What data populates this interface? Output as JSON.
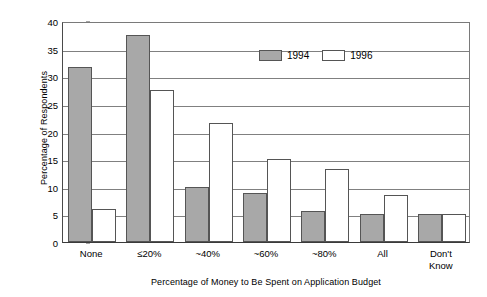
{
  "chart_data": {
    "type": "bar",
    "title": "",
    "subtitle": "",
    "xlabel": "Percentage of Money to Be Spent on Application Budget",
    "ylabel": "Percentage of Respondents",
    "categories": [
      "None",
      "≤20%",
      "~40%",
      "~60%",
      "~80%",
      "All",
      "Don't\nKnow"
    ],
    "series": [
      {
        "name": "1994",
        "color": "#a8a8a8",
        "values": [
          31.7,
          37.5,
          10.0,
          8.8,
          5.7,
          5.0,
          5.0
        ]
      },
      {
        "name": "1996",
        "color": "#ffffff",
        "values": [
          6.0,
          27.5,
          21.5,
          15.0,
          13.3,
          8.5,
          5.0
        ]
      }
    ],
    "ylim": [
      0,
      40
    ],
    "ytick_step": 5,
    "yticks": [
      "0",
      "5",
      "10",
      "15",
      "20",
      "25",
      "30",
      "35",
      "40"
    ],
    "grid": "horizontal",
    "legend_position": "top-right-inside",
    "bar_edge_color": "#555555",
    "axis_color": "#4a4a4a",
    "gridline_color": "#808080",
    "background": "#ffffff"
  }
}
